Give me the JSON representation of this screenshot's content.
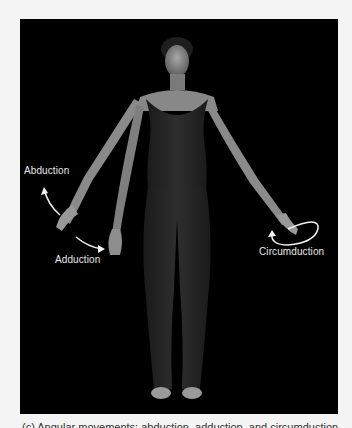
{
  "figure": {
    "background_color": "#000000",
    "page_color": "#f4f4f4",
    "annotations": [
      {
        "id": "abduction",
        "label": "Abduction"
      },
      {
        "id": "adduction",
        "label": "Adduction"
      },
      {
        "id": "circumduction",
        "label": "Circumduction"
      }
    ],
    "arrow_color": "#f2f2f2"
  },
  "caption": {
    "text": "(c) Angular movements: abduction, adduction, and circumduction"
  }
}
